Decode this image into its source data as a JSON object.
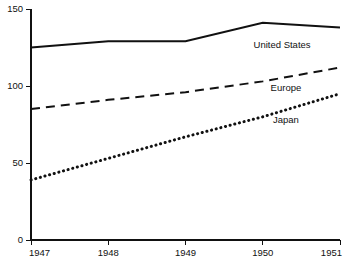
{
  "chart_data": {
    "type": "line",
    "title": "",
    "subtitle": "",
    "xlabel": "",
    "ylabel": "",
    "x": [
      1947,
      1948,
      1949,
      1950,
      1951
    ],
    "xticklabels": [
      "1947",
      "1948",
      "1949",
      "1950",
      "1951"
    ],
    "yticks": [
      0,
      50,
      100,
      150
    ],
    "yticklabels": [
      "0",
      "50",
      "100",
      "150"
    ],
    "xlim": [
      1947,
      1951
    ],
    "ylim": [
      0,
      150
    ],
    "grid": false,
    "legend_position": "inline-right",
    "series": [
      {
        "name": "United States",
        "style": "solid",
        "color": "#111111",
        "values": [
          125,
          129,
          129,
          141,
          138
        ],
        "label_x": 1950.25,
        "label_y": 125
      },
      {
        "name": "Europe",
        "style": "dashed",
        "color": "#111111",
        "values": [
          85,
          91,
          96,
          103,
          112
        ],
        "label_x": 1950.3,
        "label_y": 97
      },
      {
        "name": "Japan",
        "style": "dotted",
        "color": "#111111",
        "values": [
          39,
          53,
          67,
          80,
          95
        ],
        "label_x": 1950.3,
        "label_y": 76
      }
    ],
    "annotations": []
  },
  "caption": {
    "text": ""
  }
}
